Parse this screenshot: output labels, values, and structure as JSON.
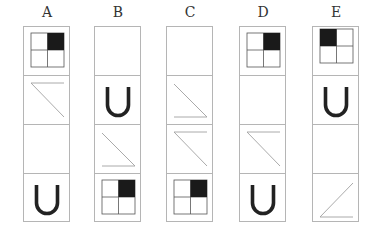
{
  "columns": [
    {
      "label": "A",
      "x": 23,
      "cells": [
        "grid-tr",
        "line-top-diag",
        "empty",
        "u-shape"
      ]
    },
    {
      "label": "B",
      "x": 94,
      "cells": [
        "empty",
        "u-shape",
        "line-diag-bottom",
        "grid-tr"
      ]
    },
    {
      "label": "C",
      "x": 166,
      "cells": [
        "empty",
        "line-diag-bottom",
        "line-top-diag",
        "grid-tr"
      ]
    },
    {
      "label": "D",
      "x": 239,
      "cells": [
        "grid-tr",
        "empty",
        "line-top-diag",
        "u-shape"
      ]
    },
    {
      "label": "E",
      "x": 312,
      "cells": [
        "grid-tl",
        "u-shape",
        "empty",
        "line-bottom-rising"
      ]
    }
  ],
  "colors": {
    "border": "#b5b5b5",
    "fill": "#1a1a1a",
    "line": "#a0a0a0",
    "u": "#222222"
  }
}
